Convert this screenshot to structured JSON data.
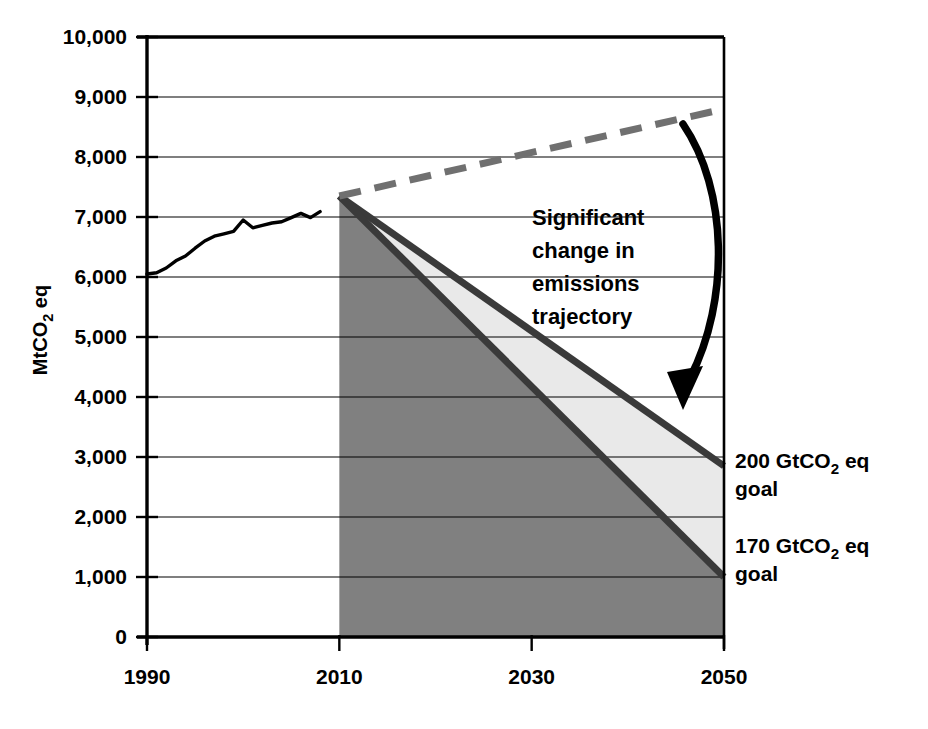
{
  "chart_data": {
    "type": "area",
    "title": "",
    "xlabel": "",
    "ylabel": "MtCO2 eq",
    "ylabel_parts": {
      "pre": "MtCO",
      "sub": "2",
      "post": " eq"
    },
    "xlim": [
      1990,
      2050
    ],
    "ylim": [
      0,
      10000
    ],
    "grid": true,
    "legend_position": "none",
    "x_ticks": [
      1990,
      2010,
      2030,
      2050
    ],
    "x_tick_labels": [
      "1990",
      "2010",
      "2030",
      "2050"
    ],
    "y_ticks": [
      0,
      1000,
      2000,
      3000,
      4000,
      5000,
      6000,
      7000,
      8000,
      9000,
      10000
    ],
    "y_tick_labels": [
      "0",
      "1,000",
      "2,000",
      "3,000",
      "4,000",
      "5,000",
      "6,000",
      "7,000",
      "8,000",
      "9,000",
      "10,000"
    ],
    "series": [
      {
        "name": "Historical emissions",
        "style": "solid-black-line",
        "color": "#000000",
        "x": [
          1990,
          1991,
          1992,
          1993,
          1994,
          1995,
          1996,
          1997,
          1998,
          1999,
          2000,
          2001,
          2002,
          2003,
          2004,
          2005,
          2006,
          2007,
          2008
        ],
        "values": [
          6050,
          6070,
          6150,
          6270,
          6350,
          6480,
          6600,
          6680,
          6720,
          6760,
          6950,
          6820,
          6860,
          6900,
          6920,
          6990,
          7060,
          6990,
          7090
        ]
      },
      {
        "name": "Business as usual (projected)",
        "style": "dashed-gray-line",
        "color": "#707070",
        "x": [
          2010,
          2050
        ],
        "values": [
          7350,
          8800
        ]
      },
      {
        "name": "200 GtCO2 eq goal",
        "style": "solid-dark-line-upper-band",
        "color": "#3a3a3a",
        "x": [
          2010,
          2050
        ],
        "values": [
          7350,
          2850
        ]
      },
      {
        "name": "170 GtCO2 eq goal",
        "style": "solid-dark-line-lower-band",
        "color": "#3a3a3a",
        "x": [
          2010,
          2050
        ],
        "values": [
          7350,
          1000
        ]
      }
    ],
    "fills": [
      {
        "name": "area-under-170-goal",
        "color": "#808080",
        "from_series": "170 GtCO2 eq goal",
        "to": 0
      },
      {
        "name": "band-between-goals",
        "color": "#e9e9e9",
        "upper": "200 GtCO2 eq goal",
        "lower": "170 GtCO2 eq goal"
      }
    ],
    "annotations": [
      {
        "name": "trajectory-callout",
        "lines": [
          "Significant",
          "change in",
          "emissions",
          "trajectory"
        ],
        "text": "Significant change in emissions trajectory",
        "arrow": {
          "from": [
            2047,
            8550
          ],
          "to": [
            2047,
            3900
          ],
          "curved": true,
          "color": "#000000"
        }
      }
    ],
    "right_labels": [
      {
        "name": "goal-200",
        "line1_pre": "200 GtCO",
        "line1_sub": "2",
        "line1_post": " eq",
        "line2": "goal",
        "at_value": 2850
      },
      {
        "name": "goal-170",
        "line1_pre": "170 GtCO",
        "line1_sub": "2",
        "line1_post": " eq",
        "line2": "goal",
        "at_value": 1000
      }
    ],
    "colors": {
      "dark_fill": "#808080",
      "light_fill": "#e9e9e9",
      "goal_line": "#3a3a3a",
      "bau_dashed": "#707070",
      "historical": "#000000",
      "axis": "#000000",
      "grid": "#000000",
      "background": "#ffffff"
    }
  }
}
